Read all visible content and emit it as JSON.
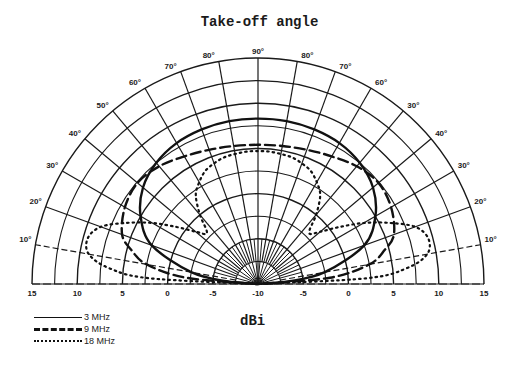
{
  "chart_data": {
    "type": "polar",
    "title": "Take-off angle",
    "xlabel": "dBi",
    "ylabel": "",
    "radial_axis": {
      "min": -10,
      "max": 15,
      "tick_labels_left": [
        "15",
        "10",
        "5",
        "0",
        "-5",
        "-10"
      ],
      "tick_labels_right": [
        "-5",
        "0",
        "5",
        "10",
        "15"
      ],
      "ring_step": 2.5
    },
    "angular_axis": {
      "range_deg": [
        0,
        180
      ],
      "tick_labels_left": [
        "10°",
        "20°",
        "30°",
        "40°",
        "50°",
        "60°",
        "70°",
        "80°"
      ],
      "top_label": "90°",
      "tick_labels_right": [
        "80°",
        "70°",
        "60°",
        "50°",
        "40°",
        "30°",
        "20°",
        "10°"
      ],
      "tick_step_deg": 10,
      "right_side_labels_as_printed": [
        "80°",
        "70°",
        "60°",
        "30°",
        "40°",
        "30°",
        "20°",
        "10°"
      ]
    },
    "grid": true,
    "legend_position": "bottom-left",
    "series": [
      {
        "name": "3 MHz",
        "style": "solid",
        "angles_deg": [
          0,
          5,
          10,
          20,
          30,
          40,
          50,
          60,
          70,
          80,
          90
        ],
        "values_dbi": [
          -10,
          -6.5,
          -2.5,
          2.5,
          5.0,
          6.6,
          7.5,
          8.0,
          8.2,
          8.3,
          8.3
        ]
      },
      {
        "name": "9 MHz",
        "style": "dashed",
        "angles_deg": [
          0,
          5,
          10,
          15,
          20,
          30,
          40,
          50,
          60,
          70,
          80,
          90
        ],
        "values_dbi": [
          -10,
          -2.0,
          2.5,
          4.5,
          6.0,
          7.0,
          7.4,
          7.0,
          6.3,
          5.8,
          5.5,
          5.4
        ]
      },
      {
        "name": "18 MHz",
        "style": "dotted",
        "angles_deg": [
          0,
          3,
          6,
          10,
          15,
          20,
          25,
          30,
          35,
          40,
          45,
          50,
          55,
          60,
          65,
          70,
          75,
          80,
          85,
          90
        ],
        "values_dbi": [
          -10,
          2.0,
          6.5,
          9.0,
          9.5,
          8.5,
          6.0,
          3.5,
          1.0,
          -1.0,
          -2.0,
          0.0,
          2.0,
          3.0,
          3.8,
          4.2,
          4.5,
          4.6,
          4.7,
          4.7
        ]
      }
    ]
  },
  "legend": {
    "items": [
      {
        "label": "3 MHz",
        "style": "solid"
      },
      {
        "label": "9 MHz",
        "style": "dashed"
      },
      {
        "label": "18 MHz",
        "style": "dotted"
      }
    ]
  }
}
